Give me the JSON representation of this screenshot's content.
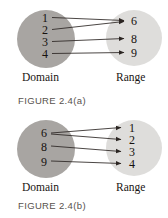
{
  "page": {
    "background_color": "#ffffff",
    "text_color": "#16110f"
  },
  "style": {
    "domain_circle_color": "#a8a5a2",
    "range_circle_color": "#dedddb",
    "arrow_color": "#2b2522",
    "caption_color": "#57514e"
  },
  "figures": [
    {
      "id": "figure-2-4-a",
      "caption": "FIGURE 2.4(a)",
      "domain": {
        "label": "Domain",
        "elements": [
          "1",
          "2",
          "3",
          "4"
        ]
      },
      "range": {
        "label": "Range",
        "elements": [
          "6",
          "8",
          "9"
        ]
      },
      "arrows": [
        {
          "from": "1",
          "to": "6"
        },
        {
          "from": "2",
          "to": "6"
        },
        {
          "from": "3",
          "to": "8"
        },
        {
          "from": "4",
          "to": "9"
        }
      ]
    },
    {
      "id": "figure-2-4-b",
      "caption": "FIGURE 2.4(b)",
      "domain": {
        "label": "Domain",
        "elements": [
          "6",
          "8",
          "9"
        ]
      },
      "range": {
        "label": "Range",
        "elements": [
          "1",
          "2",
          "3",
          "4"
        ]
      },
      "arrows": [
        {
          "from": "6",
          "to": "1"
        },
        {
          "from": "6",
          "to": "2"
        },
        {
          "from": "8",
          "to": "3"
        },
        {
          "from": "9",
          "to": "4"
        }
      ]
    }
  ]
}
